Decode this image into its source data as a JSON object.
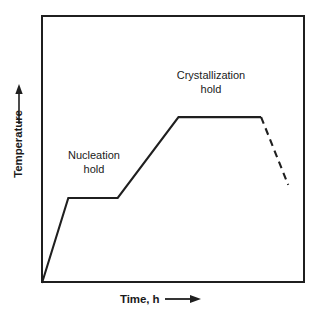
{
  "figure": {
    "type": "line-chart",
    "background_color": "#ffffff",
    "line_color": "#1f1f1f",
    "frame_color": "#1f1f1f"
  },
  "axes": {
    "y": {
      "label": "Temperature",
      "arrow_icon": "up-arrow-icon",
      "ticks": [],
      "tick_labels": []
    },
    "x": {
      "label": "Time, h",
      "arrow_icon": "right-arrow-icon",
      "ticks": [],
      "tick_labels": []
    }
  },
  "annotations": [
    {
      "id": "nucleation",
      "line1": "Nucleation",
      "line2": "hold"
    },
    {
      "id": "crystallization",
      "line1": "Crystallization",
      "line2": "hold"
    }
  ],
  "chart_data": {
    "type": "line",
    "title": "",
    "xlabel": "Time, h",
    "ylabel": "Temperature",
    "xlim": [
      0,
      1
    ],
    "ylim": [
      0,
      1
    ],
    "grid": false,
    "legend": "none",
    "axis_ticks_shown": false,
    "series": [
      {
        "name": "heat-treatment-schedule-solid",
        "style": "solid",
        "color": "#1f1f1f",
        "points": [
          {
            "x": 0.0,
            "y": 0.0,
            "label": "start"
          },
          {
            "x": 0.1,
            "y": 0.317,
            "label": "nucleation hold start"
          },
          {
            "x": 0.288,
            "y": 0.317,
            "label": "nucleation hold end"
          },
          {
            "x": 0.519,
            "y": 0.619,
            "label": "crystallization hold start"
          },
          {
            "x": 0.833,
            "y": 0.619,
            "label": "crystallization hold end"
          }
        ]
      },
      {
        "name": "cooldown-projected-dashed",
        "style": "dashed",
        "color": "#1f1f1f",
        "points": [
          {
            "x": 0.833,
            "y": 0.619,
            "label": "cooldown start"
          },
          {
            "x": 0.936,
            "y": 0.366,
            "label": "cooldown end"
          }
        ]
      }
    ],
    "annotations": [
      {
        "text": "Nucleation hold",
        "x": 0.17,
        "y": 0.47
      },
      {
        "text": "Crystallization hold",
        "x": 0.58,
        "y": 0.78
      }
    ]
  }
}
